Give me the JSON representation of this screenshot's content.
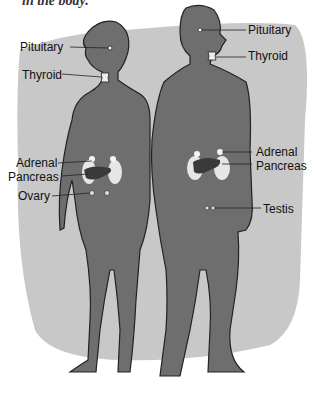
{
  "caption": "in the body.",
  "colors": {
    "backdrop": "#c8c8c8",
    "body_fill": "#6e6e6e",
    "outline": "#222222",
    "kidney": "#e6e6e6",
    "pancreas": "#3a3a3a"
  },
  "female_labels": {
    "pituitary": "Pituitary",
    "thyroid": "Thyroid",
    "adrenal": "Adrenal",
    "pancreas": "Pancreas",
    "ovary": "Ovary"
  },
  "male_labels": {
    "pituitary": "Pituitary",
    "thyroid": "Thyroid",
    "adrenal": "Adrenal",
    "pancreas": "Pancreas",
    "testis": "Testis"
  }
}
